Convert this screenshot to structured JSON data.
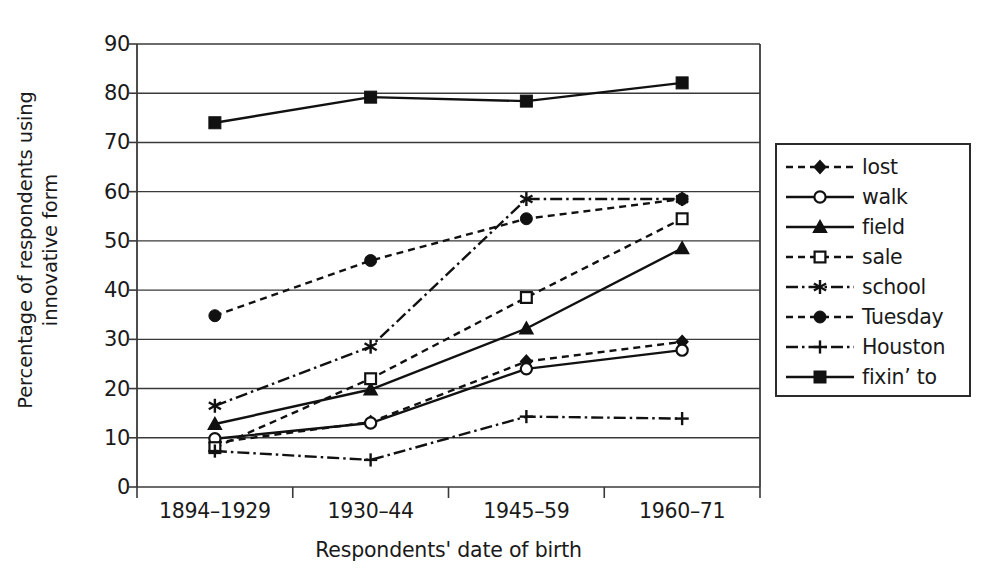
{
  "chart_data": {
    "type": "line",
    "title": "",
    "xlabel": "Respondents' date of birth",
    "ylabel_line1": "Percentage of respondents using",
    "ylabel_line2": "innovative form",
    "categories": [
      "1894–1929",
      "1930–44",
      "1945–59",
      "1960–71"
    ],
    "ylim": [
      0,
      90
    ],
    "yticks": [
      0,
      10,
      20,
      30,
      40,
      50,
      60,
      70,
      80,
      90
    ],
    "ytick_labels": [
      "0",
      "10",
      "20",
      "30",
      "40",
      "50",
      "60",
      "70",
      "80",
      "90"
    ],
    "grid": "horizontal",
    "legend_position": "right-outside",
    "series": [
      {
        "name": "lost",
        "values": [
          9.0,
          13.2,
          25.5,
          29.5
        ],
        "line_style": "dashed",
        "marker": "filled-diamond",
        "color": "#111111"
      },
      {
        "name": "walk",
        "values": [
          9.8,
          13.0,
          24.0,
          27.8
        ],
        "line_style": "solid",
        "marker": "open-circle",
        "color": "#111111"
      },
      {
        "name": "field",
        "values": [
          12.8,
          19.8,
          32.2,
          48.5
        ],
        "line_style": "solid",
        "marker": "filled-triangle",
        "color": "#111111"
      },
      {
        "name": "sale",
        "values": [
          8.0,
          22.0,
          38.5,
          54.5
        ],
        "line_style": "dashed",
        "marker": "open-square",
        "color": "#111111"
      },
      {
        "name": "school",
        "values": [
          16.5,
          28.5,
          58.5,
          58.5
        ],
        "line_style": "dash-dot",
        "marker": "asterisk",
        "color": "#111111"
      },
      {
        "name": "Tuesday",
        "values": [
          34.8,
          46.0,
          54.5,
          58.5
        ],
        "line_style": "dashed",
        "marker": "filled-circle",
        "color": "#111111"
      },
      {
        "name": "Houston",
        "values": [
          7.3,
          5.5,
          14.3,
          13.9
        ],
        "line_style": "dash-dot",
        "marker": "plus",
        "color": "#111111"
      },
      {
        "name": "fixin’ to",
        "values": [
          74.0,
          79.2,
          78.4,
          82.1
        ],
        "line_style": "solid",
        "marker": "filled-square",
        "color": "#111111"
      }
    ]
  }
}
